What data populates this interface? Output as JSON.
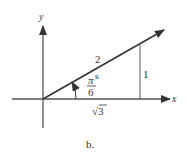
{
  "figure": {
    "caption": "b.",
    "axes": {
      "x_label": "x",
      "y_label": "y"
    },
    "triangle": {
      "hypotenuse_label": "2",
      "opposite_label": "1",
      "adjacent_label": "√3",
      "angle_label_num": "π",
      "angle_label_sup": "R",
      "angle_label_den": "6"
    },
    "colors": {
      "line": "#333333",
      "background": "#ffffff"
    }
  }
}
